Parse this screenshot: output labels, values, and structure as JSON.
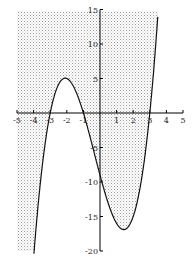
{
  "chart_data": {
    "type": "line",
    "title": "",
    "xlabel": "",
    "ylabel": "",
    "function": "y = (x+3)(x+1)(x-3) = x^3 + x^2 - 9x - 9",
    "shaded_region": "y >= f(x) (area above the curve, within the plot window)",
    "xlim": [
      -5,
      5
    ],
    "ylim": [
      -20,
      15
    ],
    "x_ticks": [
      "-5",
      "-4",
      "-3",
      "-2",
      "-1",
      "1",
      "2",
      "3",
      "4",
      "5"
    ],
    "y_ticks": [
      "15",
      "10",
      "5",
      "-5",
      "-10",
      "-15",
      "-20"
    ],
    "roots": [
      -3,
      -1,
      3
    ],
    "local_max": {
      "x": -2,
      "y": 5
    },
    "local_min": {
      "x": 1.55,
      "y": -16.9
    },
    "y_intercept": -9,
    "grid": false,
    "colors": {
      "curve": "#000000",
      "shading": "#b0b0b0",
      "axes": "#000000"
    }
  }
}
